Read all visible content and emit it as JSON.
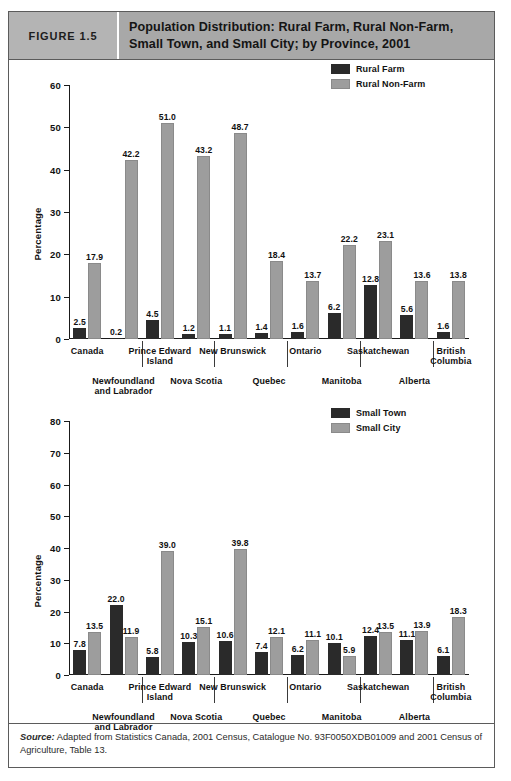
{
  "figure": {
    "tag": "FIGURE 1.5",
    "title": "Population Distribution: Rural Farm, Rural Non-Farm, Small Town, and Small City; by Province, 2001",
    "source_label": "Source:",
    "source_text": " Adapted from Statistics Canada, 2001 Census, Catalogue No. 93F0050XDB01009 and 2001 Census of Agriculture, Table 13."
  },
  "chart_data": [
    {
      "id": "chart1",
      "type": "bar",
      "title": "Population Distribution: Rural Farm, Rural Non-Farm, Small Town, and Small City; by Province, 2001",
      "xlabel": "",
      "ylabel": "Percentage",
      "ylim": [
        0,
        60
      ],
      "yticks": [
        0,
        10,
        20,
        30,
        40,
        50,
        60
      ],
      "grid": false,
      "legend_position": "top-right",
      "categories": [
        "Canada",
        "Newfoundland\nand Labrador",
        "Prince Edward\nIsland",
        "Nova Scotia",
        "New Brunswick",
        "Quebec",
        "Ontario",
        "Manitoba",
        "Saskatchewan",
        "Alberta",
        "British\nColumbia"
      ],
      "series": [
        {
          "name": "Rural Farm",
          "color": "#2a2a2a",
          "values": [
            2.5,
            0.2,
            4.5,
            1.2,
            1.1,
            1.4,
            1.6,
            6.2,
            12.8,
            5.6,
            1.6
          ]
        },
        {
          "name": "Rural Non-Farm",
          "color": "#9d9d9d",
          "values": [
            17.9,
            42.2,
            51.0,
            43.2,
            48.7,
            18.4,
            13.7,
            22.2,
            23.1,
            13.6,
            13.8
          ]
        }
      ]
    },
    {
      "id": "chart2",
      "type": "bar",
      "title": "Population Distribution: Small Town and Small City; by Province, 2001",
      "xlabel": "",
      "ylabel": "Percentage",
      "ylim": [
        0,
        80
      ],
      "yticks": [
        0,
        10,
        20,
        30,
        40,
        50,
        60,
        70,
        80
      ],
      "grid": false,
      "legend_position": "top-right",
      "categories": [
        "Canada",
        "Newfoundland\nand Labrador",
        "Prince Edward\nIsland",
        "Nova Scotia",
        "New Brunswick",
        "Quebec",
        "Ontario",
        "Manitoba",
        "Saskatchewan",
        "Alberta",
        "British\nColumbia"
      ],
      "series": [
        {
          "name": "Small Town",
          "color": "#2a2a2a",
          "values": [
            7.8,
            22.0,
            5.8,
            10.3,
            10.6,
            7.4,
            6.2,
            10.1,
            12.4,
            11.1,
            6.1
          ]
        },
        {
          "name": "Small City",
          "color": "#9d9d9d",
          "values": [
            13.5,
            11.9,
            39.0,
            15.1,
            39.8,
            12.1,
            11.1,
            5.9,
            13.5,
            13.9,
            18.3
          ]
        }
      ]
    }
  ]
}
